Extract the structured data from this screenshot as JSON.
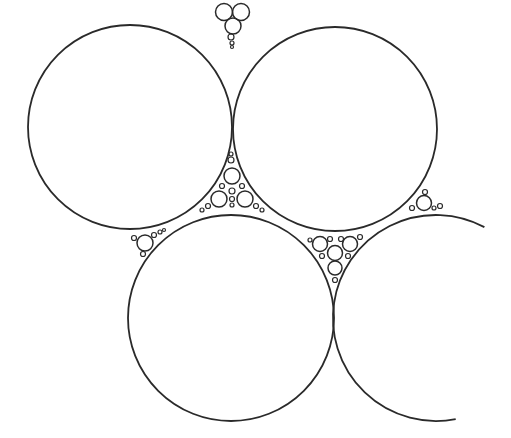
{
  "figure": {
    "title": "",
    "type": "apollonian circle packing",
    "stroke_color": "#2a2a2a",
    "background_color": "#ffffff",
    "large_circles": [
      {
        "id": "top-left",
        "cx": 130,
        "cy": 127,
        "r": 102
      },
      {
        "id": "top-right",
        "cx": 335,
        "cy": 129,
        "r": 102
      },
      {
        "id": "bottom-left",
        "cx": 231,
        "cy": 318,
        "r": 103
      }
    ],
    "partial_arc": {
      "id": "bottom-right",
      "cx": 436,
      "cy": 318,
      "r": 103,
      "start_deg": -62,
      "end_deg": 79,
      "direction": "counterclockwise-through-left"
    },
    "small_circles": [
      {
        "cx": 224,
        "cy": 12,
        "r": 8.5
      },
      {
        "cx": 241,
        "cy": 12,
        "r": 8.5
      },
      {
        "cx": 233,
        "cy": 26,
        "r": 8
      },
      {
        "cx": 231,
        "cy": 37,
        "r": 3
      },
      {
        "cx": 232,
        "cy": 43,
        "r": 2
      },
      {
        "cx": 232,
        "cy": 47,
        "r": 1.5
      },
      {
        "cx": 231,
        "cy": 154,
        "r": 2
      },
      {
        "cx": 231,
        "cy": 160,
        "r": 3
      },
      {
        "cx": 232,
        "cy": 176,
        "r": 8
      },
      {
        "cx": 219,
        "cy": 199,
        "r": 8
      },
      {
        "cx": 245,
        "cy": 199,
        "r": 8
      },
      {
        "cx": 232,
        "cy": 191,
        "r": 3
      },
      {
        "cx": 232,
        "cy": 199,
        "r": 2.5
      },
      {
        "cx": 232,
        "cy": 205,
        "r": 2
      },
      {
        "cx": 222,
        "cy": 186,
        "r": 2.5
      },
      {
        "cx": 242,
        "cy": 186,
        "r": 2.5
      },
      {
        "cx": 208,
        "cy": 206,
        "r": 2.5
      },
      {
        "cx": 256,
        "cy": 206,
        "r": 2.5
      },
      {
        "cx": 202,
        "cy": 210,
        "r": 2
      },
      {
        "cx": 262,
        "cy": 210,
        "r": 2
      },
      {
        "cx": 145,
        "cy": 243,
        "r": 8
      },
      {
        "cx": 134,
        "cy": 238,
        "r": 2.5
      },
      {
        "cx": 143,
        "cy": 254,
        "r": 2.5
      },
      {
        "cx": 154,
        "cy": 235,
        "r": 2.5
      },
      {
        "cx": 160,
        "cy": 232,
        "r": 2
      },
      {
        "cx": 164,
        "cy": 230,
        "r": 1.5
      },
      {
        "cx": 320,
        "cy": 244,
        "r": 7.5
      },
      {
        "cx": 335,
        "cy": 253,
        "r": 7.5
      },
      {
        "cx": 350,
        "cy": 244,
        "r": 7.5
      },
      {
        "cx": 335,
        "cy": 268,
        "r": 7
      },
      {
        "cx": 330,
        "cy": 239,
        "r": 2.5
      },
      {
        "cx": 341,
        "cy": 239,
        "r": 2.5
      },
      {
        "cx": 310,
        "cy": 240,
        "r": 2
      },
      {
        "cx": 360,
        "cy": 237,
        "r": 2.5
      },
      {
        "cx": 322,
        "cy": 256,
        "r": 2.5
      },
      {
        "cx": 348,
        "cy": 256,
        "r": 2.5
      },
      {
        "cx": 335,
        "cy": 280,
        "r": 2.5
      },
      {
        "cx": 424,
        "cy": 203,
        "r": 7.5
      },
      {
        "cx": 412,
        "cy": 208,
        "r": 2.5
      },
      {
        "cx": 425,
        "cy": 192,
        "r": 2.5
      },
      {
        "cx": 434,
        "cy": 208,
        "r": 2
      },
      {
        "cx": 440,
        "cy": 206,
        "r": 2.5
      }
    ]
  }
}
